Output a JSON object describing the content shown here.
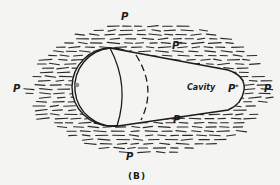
{
  "figure": {
    "caption": "(B)",
    "cavity_label": "Cavity",
    "pressure_labels": {
      "top": "P",
      "left": "P",
      "right": "P",
      "bottom": "P"
    },
    "cavity_pressure_labels": {
      "top": "P",
      "right": "P",
      "bottom": "P",
      "star": "*"
    },
    "colors": {
      "ink": "#1c1c1c",
      "background": "#f4f4f2",
      "dot": "#8a8a8a"
    }
  }
}
